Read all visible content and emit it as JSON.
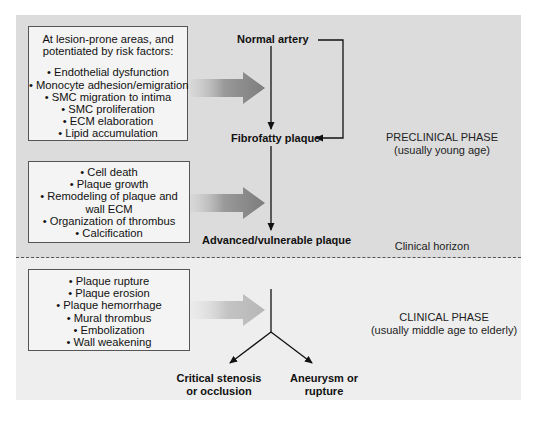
{
  "diagram": {
    "preclinical_phase": {
      "label_line1": "PRECLINICAL PHASE",
      "label_line2": "(usually young age)",
      "background_color": "#dcdcdc"
    },
    "clinical_phase": {
      "label_line1": "CLINICAL PHASE",
      "label_line2": "(usually middle age to elderly)",
      "background_color": "#eeeeee"
    },
    "clinical_horizon": "Clinical horizon",
    "boxes": [
      {
        "intro_line1": "At lesion-prone areas, and",
        "intro_line2": "potentiated by risk factors:",
        "items": [
          "• Endothelial dysfunction",
          "• Monocyte adhesion/emigration",
          "• SMC migration to intima",
          "• SMC proliferation",
          "• ECM elaboration",
          "• Lipid accumulation"
        ]
      },
      {
        "items": [
          "• Cell death",
          "• Plaque growth",
          "• Remodeling of plaque and",
          "wall ECM",
          "• Organization of thrombus",
          "• Calcification"
        ]
      },
      {
        "items": [
          "• Plaque rupture",
          "• Plaque erosion",
          "• Plaque hemorrhage",
          "• Mural thrombus",
          "• Embolization",
          "• Wall weakening"
        ]
      }
    ],
    "nodes": {
      "normal_artery": "Normal artery",
      "fibrofatty_plaque": "Fibrofatty plaque",
      "advanced_plaque": "Advanced/vulnerable plaque",
      "critical_stenosis_line1": "Critical stenosis",
      "critical_stenosis_line2": "or occlusion",
      "aneurysm_line1": "Aneurysm or",
      "aneurysm_line2": "rupture"
    },
    "arrow_color": "#8a8a8a"
  }
}
